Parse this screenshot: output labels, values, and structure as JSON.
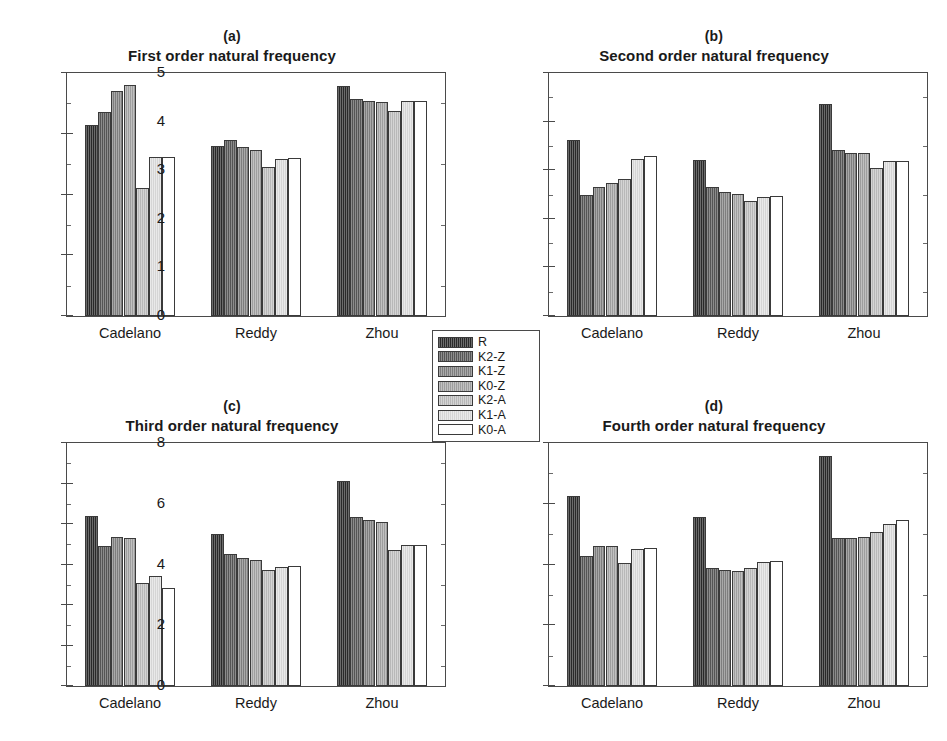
{
  "figure": {
    "background": "#ffffff",
    "legend": {
      "entries": [
        {
          "label": "R",
          "color": "#2b2b2b"
        },
        {
          "label": "K2-Z",
          "color": "#5a5a5a"
        },
        {
          "label": "K1-Z",
          "color": "#848484"
        },
        {
          "label": "K0-Z",
          "color": "#a6a6a6"
        },
        {
          "label": "K2-A",
          "color": "#c2c2c2"
        },
        {
          "label": "K1-A",
          "color": "#e0e0e0"
        },
        {
          "label": "K0-A",
          "color": "#ffffff"
        }
      ]
    }
  },
  "chart_data": [
    {
      "type": "bar",
      "panel": "(a)",
      "title": "First order natural frequency",
      "categories": [
        "Cadelano",
        "Reddy",
        "Zhou"
      ],
      "xlabel": "",
      "ylabel": "",
      "ylim": [
        0,
        2
      ],
      "yticks": [
        0,
        0.5,
        1,
        1.5,
        2
      ],
      "yticklabels": [
        "0",
        "0.5",
        "1",
        "1.5",
        "2"
      ],
      "grid": false,
      "legend_position": "figure-center",
      "series": [
        {
          "name": "R",
          "values": [
            1.57,
            1.4,
            1.89
          ]
        },
        {
          "name": "K2-Z",
          "values": [
            1.68,
            1.45,
            1.79
          ]
        },
        {
          "name": "K1-Z",
          "values": [
            1.85,
            1.39,
            1.77
          ]
        },
        {
          "name": "K0-Z",
          "values": [
            1.9,
            1.37,
            1.76
          ]
        },
        {
          "name": "K2-A",
          "values": [
            1.05,
            1.23,
            1.69
          ]
        },
        {
          "name": "K1-A",
          "values": [
            1.31,
            1.29,
            1.77
          ]
        },
        {
          "name": "K0-A",
          "values": [
            1.31,
            1.3,
            1.77
          ]
        }
      ]
    },
    {
      "type": "bar",
      "panel": "(b)",
      "title": "Second order natural frequency",
      "categories": [
        "Cadelano",
        "Reddy",
        "Zhou"
      ],
      "xlabel": "",
      "ylabel": "",
      "ylim": [
        0,
        5
      ],
      "yticks": [
        0,
        1,
        2,
        3,
        4,
        5
      ],
      "yticklabels": [
        "0",
        "1",
        "2",
        "3",
        "4",
        "5"
      ],
      "grid": false,
      "legend_position": "figure-center",
      "series": [
        {
          "name": "R",
          "values": [
            3.63,
            3.22,
            4.36
          ]
        },
        {
          "name": "K2-Z",
          "values": [
            2.48,
            2.65,
            3.42
          ]
        },
        {
          "name": "K1-Z",
          "values": [
            2.65,
            2.55,
            3.36
          ]
        },
        {
          "name": "K0-Z",
          "values": [
            2.74,
            2.52,
            3.35
          ]
        },
        {
          "name": "K2-A",
          "values": [
            2.82,
            2.37,
            3.05
          ]
        },
        {
          "name": "K1-A",
          "values": [
            3.24,
            2.45,
            3.19
          ]
        },
        {
          "name": "K0-A",
          "values": [
            3.3,
            2.46,
            3.19
          ]
        }
      ]
    },
    {
      "type": "bar",
      "panel": "(c)",
      "title": "Third order natural frequency",
      "categories": [
        "Cadelano",
        "Reddy",
        "Zhou"
      ],
      "xlabel": "",
      "ylabel": "",
      "ylim": [
        0,
        6
      ],
      "yticks": [
        0,
        1,
        2,
        3,
        4,
        5,
        6
      ],
      "yticklabels": [
        "0",
        "1",
        "2",
        "3",
        "4",
        "5",
        "6"
      ],
      "grid": false,
      "legend_position": "figure-center",
      "series": [
        {
          "name": "R",
          "values": [
            4.21,
            3.75,
            5.05
          ]
        },
        {
          "name": "K2-Z",
          "values": [
            3.46,
            3.26,
            4.18
          ]
        },
        {
          "name": "K1-Z",
          "values": [
            3.68,
            3.17,
            4.09
          ]
        },
        {
          "name": "K0-Z",
          "values": [
            3.66,
            3.1,
            4.04
          ]
        },
        {
          "name": "K2-A",
          "values": [
            2.55,
            2.87,
            3.35
          ]
        },
        {
          "name": "K1-A",
          "values": [
            2.71,
            2.94,
            3.47
          ]
        },
        {
          "name": "K0-A",
          "values": [
            2.42,
            2.97,
            3.49
          ]
        }
      ]
    },
    {
      "type": "bar",
      "panel": "(d)",
      "title": "Fourth order natural frequency",
      "categories": [
        "Cadelano",
        "Reddy",
        "Zhou"
      ],
      "xlabel": "",
      "ylabel": "",
      "ylim": [
        0,
        8
      ],
      "yticks": [
        0,
        2,
        4,
        6,
        8
      ],
      "yticklabels": [
        "0",
        "2",
        "4",
        "6",
        "8"
      ],
      "grid": false,
      "legend_position": "figure-center",
      "series": [
        {
          "name": "R",
          "values": [
            6.25,
            5.55,
            7.57
          ]
        },
        {
          "name": "K2-Z",
          "values": [
            4.28,
            3.88,
            4.86
          ]
        },
        {
          "name": "K1-Z",
          "values": [
            4.6,
            3.82,
            4.87
          ]
        },
        {
          "name": "K0-Z",
          "values": [
            4.62,
            3.79,
            4.92
          ]
        },
        {
          "name": "K2-A",
          "values": [
            4.04,
            3.9,
            5.07
          ]
        },
        {
          "name": "K1-A",
          "values": [
            4.52,
            4.07,
            5.34
          ]
        },
        {
          "name": "K0-A",
          "values": [
            4.53,
            4.13,
            5.45
          ]
        }
      ]
    }
  ]
}
